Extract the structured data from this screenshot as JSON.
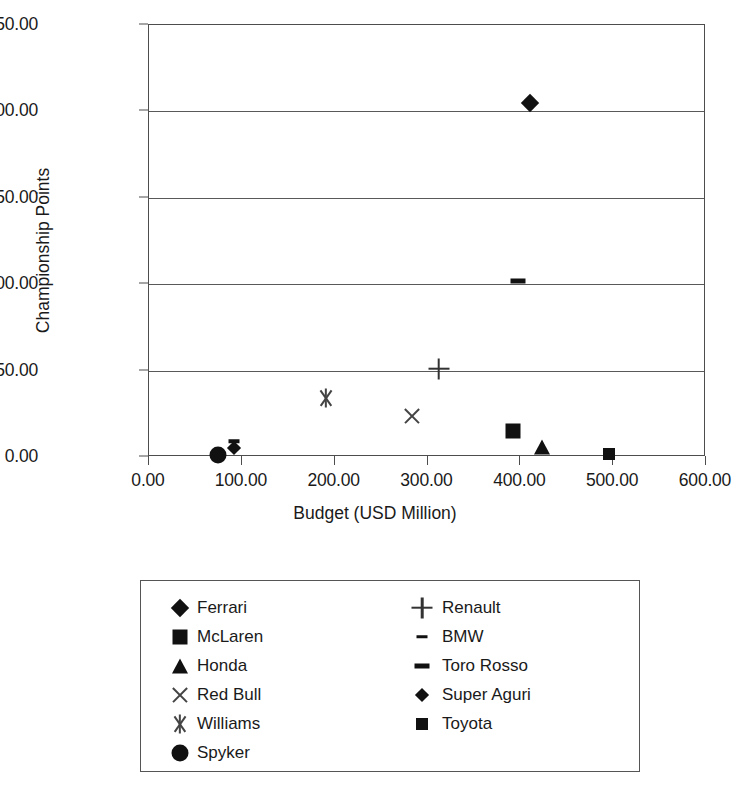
{
  "chart_data": {
    "type": "scatter",
    "title": "",
    "xlabel": "Budget (USD Million)",
    "ylabel": "Championship Points",
    "xlim": [
      0,
      600
    ],
    "ylim": [
      0,
      250
    ],
    "xticks": [
      "0.00",
      "100.00",
      "200.00",
      "300.00",
      "400.00",
      "500.00",
      "600.00"
    ],
    "xtick_values": [
      0,
      100,
      200,
      300,
      400,
      500,
      600
    ],
    "yticks": [
      "0.00",
      "50.00",
      "100.00",
      "150.00",
      "200.00",
      "250.00"
    ],
    "ytick_values": [
      0,
      50,
      100,
      150,
      200,
      250
    ],
    "grid": "horizontal",
    "legend_position": "below-plot",
    "series": [
      {
        "name": "Ferrari",
        "marker": "diamond",
        "x": 410,
        "y": 205
      },
      {
        "name": "McLaren",
        "marker": "square",
        "x": 392,
        "y": 15
      },
      {
        "name": "Honda",
        "marker": "triangle",
        "x": 423,
        "y": 6
      },
      {
        "name": "Red Bull",
        "marker": "x",
        "x": 283,
        "y": 24
      },
      {
        "name": "Williams",
        "marker": "asterisk",
        "x": 191,
        "y": 34
      },
      {
        "name": "Spyker",
        "marker": "circle",
        "x": 74,
        "y": 1
      },
      {
        "name": "Renault",
        "marker": "plus",
        "x": 312,
        "y": 51
      },
      {
        "name": "BMW",
        "marker": "dash-short",
        "x": 92,
        "y": 9
      },
      {
        "name": "Toro Rosso",
        "marker": "dash-long",
        "x": 398,
        "y": 102
      },
      {
        "name": "Super Aguri",
        "marker": "diamond-small",
        "x": 92,
        "y": 5
      },
      {
        "name": "Toyota",
        "marker": "square-small",
        "x": 495,
        "y": 2
      }
    ]
  },
  "legend": {
    "left_column": [
      "Ferrari",
      "McLaren",
      "Honda",
      "Red Bull",
      "Williams",
      "Spyker"
    ],
    "right_column": [
      "Renault",
      "BMW",
      "Toro Rosso",
      "Super Aguri",
      "Toyota"
    ]
  },
  "colors": {
    "marker": "#111111",
    "axis": "#4d4d4d",
    "gridline": "#595959",
    "background": "#ffffff"
  }
}
